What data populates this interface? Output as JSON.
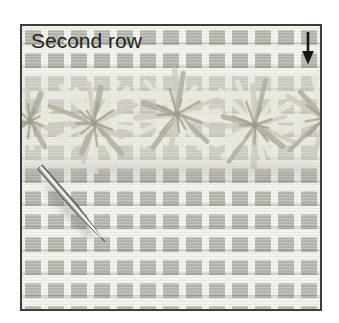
{
  "figure": {
    "label": "Second row",
    "annotations": {
      "arrow_icon": "down-arrow"
    },
    "objects": {
      "background": "needlepoint-canvas",
      "band": "flower-stitch-band",
      "tool": "tapestry-needle"
    },
    "colors": {
      "page_bg": "#ffffff",
      "frame_border": "#3c3c3a",
      "canvas_base": "#f2f1eb",
      "canvas_thread": "#b6b5ad",
      "stitch_light": "#e9e8dc",
      "stitch_mid": "#cecdbf",
      "stitch_dark": "#b0afa0",
      "stitch_deep": "#9c9b8d",
      "needle_dark": "#55544f",
      "needle_mid": "#a9a8a4",
      "needle_light": "#f4f4f2",
      "label_color": "#232321",
      "arrow_color": "#151513"
    }
  }
}
